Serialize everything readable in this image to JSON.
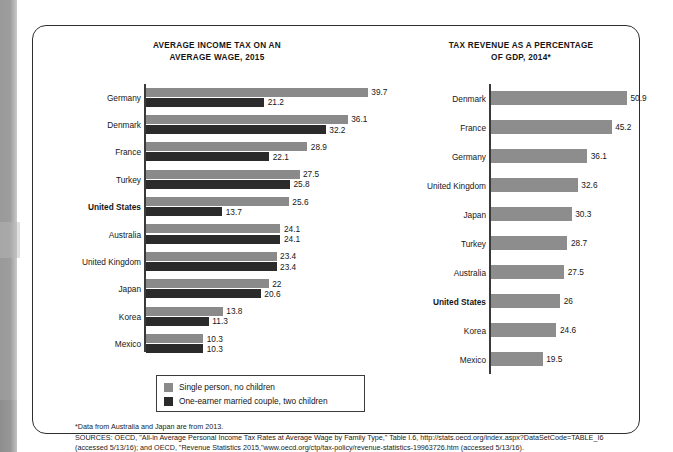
{
  "figure": {
    "background_color": "#ffffff",
    "border_color": "#2e2e2e"
  },
  "colors": {
    "bar_light_gray": "#8a8a8a",
    "bar_dark": "#2b2b2b",
    "bar_right_gray": "#8d8d8d",
    "axis": "#3a3a3a",
    "text": "#161616"
  },
  "legend": {
    "items": [
      {
        "label": "Single person, no children",
        "color": "#8a8a8a",
        "swatch_name": "legend-swatch-single-person"
      },
      {
        "label": "One-earner married couple, two children",
        "color": "#2b2b2b",
        "swatch_name": "legend-swatch-married-couple"
      }
    ]
  },
  "footnotes": {
    "line1": "*Data from Australia and Japan are from 2013.",
    "line2": "SOURCES: OECD, \"All-in Average Personal Income Tax Rates at Average Wage by Family Type,\" Table I.6, http://stats.oecd.org/index.aspx?DataSetCode=TABLE_I6",
    "line3": "(accessed 5/13/16); and OECD, \"Revenue Statistics 2015,\"www.oecd.org/ctp/tax-policy/revenue-statistics-19963726.htm (accessed 5/13/16)."
  },
  "chart_data": [
    {
      "type": "bar",
      "id": "average-income-tax",
      "title": "AVERAGE INCOME TAX ON AN AVERAGE WAGE, 2015",
      "title_line1": "AVERAGE INCOME TAX ON AN",
      "title_line2": "AVERAGE WAGE, 2015",
      "orientation": "horizontal",
      "grouped": true,
      "xlabel": "",
      "ylabel": "",
      "xlim": [
        0,
        39.7
      ],
      "grid": false,
      "legend_position": "bottom",
      "highlighted_category": "United States",
      "categories": [
        "Germany",
        "Denmark",
        "France",
        "Turkey",
        "United States",
        "Australia",
        "United Kingdom",
        "Japan",
        "Korea",
        "Mexico"
      ],
      "series": [
        {
          "name": "Single person, no children",
          "color": "#8a8a8a",
          "values": [
            39.7,
            36.1,
            28.9,
            27.5,
            25.6,
            24.1,
            23.4,
            22,
            13.8,
            10.3
          ]
        },
        {
          "name": "One-earner married couple, two children",
          "color": "#2b2b2b",
          "values": [
            21.2,
            32.2,
            22.1,
            25.8,
            13.7,
            24.1,
            23.4,
            20.6,
            11.3,
            10.3
          ]
        }
      ],
      "value_labels": [
        {
          "category": "Germany",
          "single": "39.7",
          "married": "21.2"
        },
        {
          "category": "Denmark",
          "single": "36.1",
          "married": "32.2"
        },
        {
          "category": "France",
          "single": "28.9",
          "married": "22.1"
        },
        {
          "category": "Turkey",
          "single": "27.5",
          "married": "25.8"
        },
        {
          "category": "United States",
          "single": "25.6",
          "married": "13.7"
        },
        {
          "category": "Australia",
          "single": "24.1",
          "married": "24.1"
        },
        {
          "category": "United Kingdom",
          "single": "23.4",
          "married": "23.4"
        },
        {
          "category": "Japan",
          "single": "22",
          "married": "20.6"
        },
        {
          "category": "Korea",
          "single": "13.8",
          "married": "11.3"
        },
        {
          "category": "Mexico",
          "single": "10.3",
          "married": "10.3"
        }
      ]
    },
    {
      "type": "bar",
      "id": "tax-revenue-gdp",
      "title": "TAX REVENUE AS A PERCENTAGE OF GDP, 2014*",
      "title_line1": "TAX REVENUE AS A PERCENTAGE",
      "title_line2": "OF GDP, 2014*",
      "orientation": "horizontal",
      "grouped": false,
      "xlabel": "",
      "ylabel": "",
      "xlim": [
        0,
        50.9
      ],
      "grid": false,
      "highlighted_category": "United States",
      "categories": [
        "Denmark",
        "France",
        "Germany",
        "United Kingdom",
        "Japan",
        "Turkey",
        "Australia",
        "United States",
        "Korea",
        "Mexico"
      ],
      "series": [
        {
          "name": "Tax revenue as a percentage of GDP",
          "color": "#8d8d8d",
          "values": [
            50.9,
            45.2,
            36.1,
            32.6,
            30.3,
            28.7,
            27.5,
            26,
            24.6,
            19.5
          ]
        }
      ],
      "value_labels": [
        {
          "category": "Denmark",
          "value": "50.9"
        },
        {
          "category": "France",
          "value": "45.2"
        },
        {
          "category": "Germany",
          "value": "36.1"
        },
        {
          "category": "United Kingdom",
          "value": "32.6"
        },
        {
          "category": "Japan",
          "value": "30.3"
        },
        {
          "category": "Turkey",
          "value": "28.7"
        },
        {
          "category": "Australia",
          "value": "27.5"
        },
        {
          "category": "United States",
          "value": "26"
        },
        {
          "category": "Korea",
          "value": "24.6"
        },
        {
          "category": "Mexico",
          "value": "19.5"
        }
      ]
    }
  ]
}
